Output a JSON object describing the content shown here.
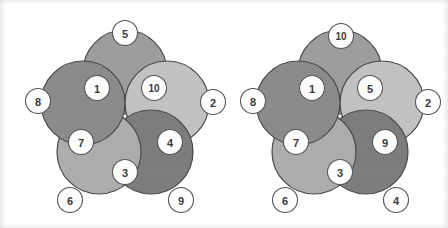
{
  "canvas": {
    "width": 448,
    "height": 228,
    "background": "#ffffff"
  },
  "style": {
    "petal_outline_color": "#4a4a4a",
    "node_fill": "#fdfdfd",
    "node_outline": "#555555",
    "node_text_color": "#3b3b3b",
    "petal_radius": 42,
    "node_radius": 12.5
  },
  "figures": [
    {
      "id": "left-rosette",
      "name": "left-rosette",
      "center": {
        "x": 125,
        "y": 116
      },
      "petals": [
        {
          "id": "left-petal-top",
          "name": "petal-top",
          "cx": 125,
          "cy": 72,
          "r": 42,
          "color": "#9d9d9d"
        },
        {
          "id": "left-petal-right",
          "name": "petal-right",
          "cx": 167,
          "cy": 103,
          "r": 42,
          "color": "#c2c2c2"
        },
        {
          "id": "left-petal-bottom-right",
          "name": "petal-bottom-right",
          "cx": 151,
          "cy": 152,
          "r": 42,
          "color": "#7d7d7d"
        },
        {
          "id": "left-petal-bottom-left",
          "name": "petal-bottom-left",
          "cx": 99,
          "cy": 152,
          "r": 42,
          "color": "#adadad"
        },
        {
          "id": "left-petal-left",
          "name": "petal-left",
          "cx": 83,
          "cy": 103,
          "r": 42,
          "color": "#8b8b8b"
        }
      ],
      "nodes": [
        {
          "id": "left-node-5",
          "name": "node-5",
          "label": "5",
          "cx": 125,
          "cy": 33
        },
        {
          "id": "left-node-2",
          "name": "node-2",
          "label": "2",
          "cx": 213,
          "cy": 102
        },
        {
          "id": "left-node-9",
          "name": "node-9",
          "label": "9",
          "cx": 181,
          "cy": 200
        },
        {
          "id": "left-node-6",
          "name": "node-6",
          "label": "6",
          "cx": 70,
          "cy": 200
        },
        {
          "id": "left-node-8",
          "name": "node-8",
          "label": "8",
          "cx": 38,
          "cy": 101
        },
        {
          "id": "left-node-1",
          "name": "node-1",
          "label": "1",
          "cx": 97,
          "cy": 88
        },
        {
          "id": "left-node-10",
          "name": "node-10",
          "label": "10",
          "cx": 154,
          "cy": 88
        },
        {
          "id": "left-node-4",
          "name": "node-4",
          "label": "4",
          "cx": 170,
          "cy": 142
        },
        {
          "id": "left-node-3",
          "name": "node-3",
          "label": "3",
          "cx": 125,
          "cy": 172
        },
        {
          "id": "left-node-7",
          "name": "node-7",
          "label": "7",
          "cx": 81,
          "cy": 142
        }
      ]
    },
    {
      "id": "right-rosette",
      "name": "right-rosette",
      "center": {
        "x": 340,
        "y": 116
      },
      "petals": [
        {
          "id": "right-petal-top",
          "name": "petal-top",
          "cx": 340,
          "cy": 72,
          "r": 42,
          "color": "#9d9d9d"
        },
        {
          "id": "right-petal-right",
          "name": "petal-right",
          "cx": 382,
          "cy": 103,
          "r": 42,
          "color": "#c2c2c2"
        },
        {
          "id": "right-petal-bottom-right",
          "name": "petal-bottom-right",
          "cx": 366,
          "cy": 152,
          "r": 42,
          "color": "#7d7d7d"
        },
        {
          "id": "right-petal-bottom-left",
          "name": "petal-bottom-left",
          "cx": 314,
          "cy": 152,
          "r": 42,
          "color": "#adadad"
        },
        {
          "id": "right-petal-left",
          "name": "petal-left",
          "cx": 298,
          "cy": 103,
          "r": 42,
          "color": "#8b8b8b"
        }
      ],
      "nodes": [
        {
          "id": "right-node-10",
          "name": "node-10",
          "label": "10",
          "cx": 341,
          "cy": 36
        },
        {
          "id": "right-node-2",
          "name": "node-2",
          "label": "2",
          "cx": 428,
          "cy": 102
        },
        {
          "id": "right-node-4",
          "name": "node-4",
          "label": "4",
          "cx": 396,
          "cy": 200
        },
        {
          "id": "right-node-6",
          "name": "node-6",
          "label": "6",
          "cx": 285,
          "cy": 200
        },
        {
          "id": "right-node-8",
          "name": "node-8",
          "label": "8",
          "cx": 253,
          "cy": 101
        },
        {
          "id": "right-node-1",
          "name": "node-1",
          "label": "1",
          "cx": 312,
          "cy": 88
        },
        {
          "id": "right-node-5",
          "name": "node-5",
          "label": "5",
          "cx": 370,
          "cy": 88
        },
        {
          "id": "right-node-9",
          "name": "node-9",
          "label": "9",
          "cx": 385,
          "cy": 142
        },
        {
          "id": "right-node-3",
          "name": "node-3",
          "label": "3",
          "cx": 340,
          "cy": 172
        },
        {
          "id": "right-node-7",
          "name": "node-7",
          "label": "7",
          "cx": 296,
          "cy": 142
        }
      ]
    }
  ]
}
